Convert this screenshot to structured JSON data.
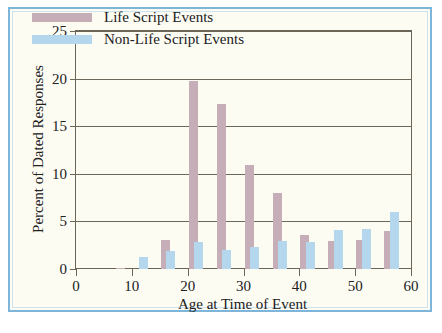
{
  "figure": {
    "frame_color": "#7fb5d8",
    "background_color": "#fdfcf3"
  },
  "chart_data": {
    "type": "bar",
    "title": "",
    "xlabel": "Age at Time of Event",
    "ylabel": "Percent of Dated Responses",
    "xlim": [
      0,
      60
    ],
    "ylim": [
      0,
      25
    ],
    "xticks": [
      0,
      10,
      20,
      30,
      40,
      50,
      60
    ],
    "xtick_labels": [
      "0",
      "10",
      "20",
      "30",
      "40",
      "50",
      "60"
    ],
    "yticks": [
      0,
      5,
      10,
      15,
      20,
      25
    ],
    "ytick_labels": [
      "0",
      "5",
      "10",
      "15",
      "20",
      "25"
    ],
    "grid": "horizontal",
    "legend_position": "upper-left-inside",
    "series": [
      {
        "name": "Life Script Events",
        "color": "#c6aeb8",
        "x": [
          8,
          16,
          21,
          26,
          31,
          36,
          41,
          46,
          51,
          56
        ],
        "values": [
          0.15,
          3.0,
          19.8,
          17.3,
          10.9,
          8.0,
          3.6,
          2.9,
          3.1,
          4.0
        ]
      },
      {
        "name": "Non-Life Script Events",
        "color": "#b5d7ee",
        "x": [
          12,
          17,
          22,
          27,
          32,
          37,
          42,
          47,
          52,
          57
        ],
        "values": [
          1.3,
          1.9,
          2.8,
          2.0,
          2.3,
          2.9,
          2.8,
          4.1,
          4.2,
          6.0
        ]
      }
    ]
  },
  "legend": {
    "items": [
      {
        "label": "Life Script Events",
        "color": "#c6aeb8"
      },
      {
        "label": "Non-Life Script Events",
        "color": "#b5d7ee"
      }
    ]
  }
}
